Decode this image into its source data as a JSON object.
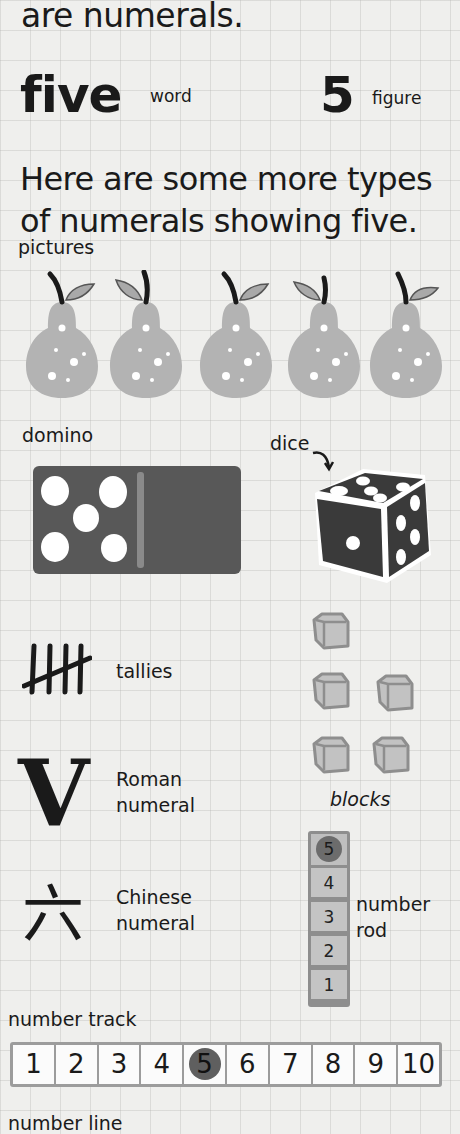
{
  "intro": {
    "text": "are numerals."
  },
  "representations": {
    "word": {
      "value": "five",
      "label": "word"
    },
    "figure": {
      "value": "5",
      "label": "figure"
    }
  },
  "paragraph": {
    "text": "Here are some more types of numerals showing five."
  },
  "sections": {
    "pictures": {
      "label": "pictures",
      "count": 5,
      "object": "pear"
    },
    "domino": {
      "label": "domino",
      "pips_left": 5,
      "pips_right": 0
    },
    "dice": {
      "label": "dice",
      "front_face": 1,
      "top_face": 5,
      "side_face": 4
    },
    "tallies": {
      "label": "tallies",
      "count": 5
    },
    "roman": {
      "glyph": "V",
      "label_line1": "Roman",
      "label_line2": "numeral"
    },
    "chinese": {
      "glyph": "六",
      "label_line1": "Chinese",
      "label_line2": "numeral"
    },
    "blocks": {
      "label": "blocks",
      "count": 5
    },
    "number_rod": {
      "label_line1": "number",
      "label_line2": "rod",
      "cells": [
        "5",
        "4",
        "3",
        "2",
        "1"
      ],
      "highlighted": "5"
    },
    "number_track": {
      "label": "number track",
      "cells": [
        "1",
        "2",
        "3",
        "4",
        "5",
        "6",
        "7",
        "8",
        "9",
        "10"
      ],
      "highlighted": "5"
    },
    "number_line": {
      "label": "number line"
    }
  },
  "colors": {
    "background": "#efefed",
    "pear_fill": "#b3b3b3",
    "leaf_fill": "#a9a9a9",
    "domino_fill": "#585858",
    "dice_fill": "#3a3a3a",
    "block_fill": "#c2c2c2",
    "block_stroke": "#8e8e8e",
    "highlight_dot": "#5f5f5f"
  }
}
